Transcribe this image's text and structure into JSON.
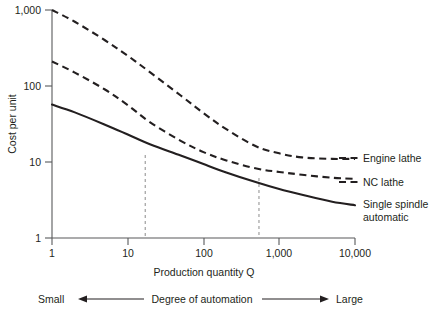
{
  "chart_data": {
    "type": "line",
    "title": "",
    "xlabel": "Production quantity Q",
    "ylabel": "Cost per unit",
    "xscale": "log",
    "yscale": "log",
    "xlim": [
      1,
      10000
    ],
    "ylim": [
      1,
      1000
    ],
    "grid": false,
    "legend_position": "right",
    "xticks": [
      1,
      10,
      100,
      1000,
      10000
    ],
    "xtick_labels": [
      "1",
      "10",
      "100",
      "1,000",
      "10,000"
    ],
    "yticks": [
      1,
      10,
      100,
      1000
    ],
    "ytick_labels": [
      "1",
      "10",
      "100",
      "1,000"
    ],
    "series": [
      {
        "name": "Engine lathe",
        "style": "dashed",
        "x": [
          1,
          2,
          5,
          10,
          20,
          50,
          100,
          200,
          500,
          1000,
          2000,
          5000,
          10000
        ],
        "y": [
          1000,
          700,
          400,
          250,
          150,
          75,
          44,
          27,
          16,
          13,
          11.5,
          11,
          11
        ]
      },
      {
        "name": "NC lathe",
        "style": "dashed",
        "x": [
          1,
          2,
          5,
          10,
          20,
          50,
          100,
          200,
          500,
          1000,
          2000,
          5000,
          10000
        ],
        "y": [
          210,
          150,
          90,
          56,
          33,
          19,
          13.5,
          10.5,
          8.2,
          7.4,
          6.8,
          6.2,
          6.0
        ]
      },
      {
        "name": "Single spindle automatic",
        "style": "solid",
        "x": [
          1,
          2,
          5,
          10,
          20,
          50,
          100,
          200,
          500,
          1000,
          2000,
          5000,
          10000
        ],
        "y": [
          57,
          45,
          31,
          23,
          17,
          12.2,
          9.4,
          7.3,
          5.4,
          4.4,
          3.7,
          3.0,
          2.7
        ]
      }
    ],
    "annotations": [
      {
        "type": "vertical-guide",
        "x": 17,
        "note": "Engine lathe / single spindle automatic breakeven"
      },
      {
        "type": "vertical-guide",
        "x": 540,
        "note": "NC lathe / single spindle automatic breakeven"
      }
    ]
  },
  "legend": {
    "engine_lathe": "Engine lathe",
    "nc_lathe": "NC lathe",
    "single_spindle_line1": "Single spindle",
    "single_spindle_line2": "automatic"
  },
  "axes": {
    "y_title": "Cost per unit",
    "x_title": "Production quantity Q",
    "y_tick_1000": "1,000",
    "y_tick_100": "100",
    "y_tick_10": "10",
    "y_tick_1": "1",
    "x_tick_1": "1",
    "x_tick_10": "10",
    "x_tick_100": "100",
    "x_tick_1000": "1,000",
    "x_tick_10000": "10,000"
  },
  "automation_scale": {
    "left_label": "Small",
    "center_label": "Degree of automation",
    "right_label": "Large"
  },
  "colors": {
    "ink": "#231f20",
    "axis": "#58595b",
    "guide": "#8c8c8c"
  }
}
